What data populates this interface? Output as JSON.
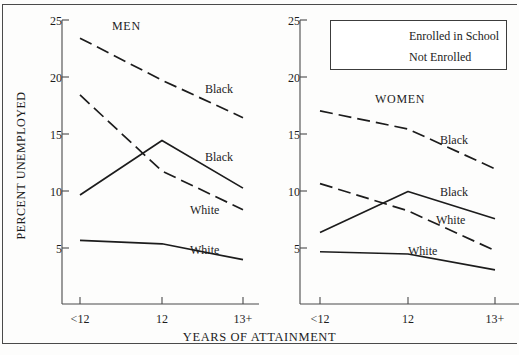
{
  "chart_data": {
    "type": "line",
    "title": "",
    "xlabel": "YEARS OF ATTAINMENT",
    "ylabel": "PERCENT UNEMPLOYED",
    "categories": [
      "<12",
      "12",
      "13+"
    ],
    "ylim": [
      0,
      25
    ],
    "yticks": [
      5,
      10,
      15,
      20,
      25
    ],
    "grid": false,
    "legend_position": "top-right",
    "legend": [
      {
        "name": "Enrolled in School",
        "style": "solid"
      },
      {
        "name": "Not Enrolled",
        "style": "dashed"
      }
    ],
    "panels": [
      {
        "name": "MEN",
        "series": [
          {
            "name": "Black",
            "enrollment": "Not Enrolled",
            "style": "dashed",
            "values": [
              23.4,
              19.7,
              16.4
            ],
            "label": "Black"
          },
          {
            "name": "White",
            "enrollment": "Not Enrolled",
            "style": "dashed",
            "values": [
              18.4,
              11.7,
              8.3
            ],
            "label": "White"
          },
          {
            "name": "Black",
            "enrollment": "Enrolled in School",
            "style": "solid",
            "values": [
              9.6,
              14.4,
              10.2
            ],
            "label": "Black"
          },
          {
            "name": "White",
            "enrollment": "Enrolled in School",
            "style": "solid",
            "values": [
              5.6,
              5.3,
              3.9
            ],
            "label": "White"
          }
        ]
      },
      {
        "name": "WOMEN",
        "series": [
          {
            "name": "Black",
            "enrollment": "Not Enrolled",
            "style": "dashed",
            "values": [
              17.0,
              15.4,
              11.9
            ],
            "label": "Black"
          },
          {
            "name": "White",
            "enrollment": "Not Enrolled",
            "style": "dashed",
            "values": [
              10.6,
              8.2,
              4.7
            ],
            "label": "White"
          },
          {
            "name": "Black",
            "enrollment": "Enrolled in School",
            "style": "solid",
            "values": [
              6.3,
              9.9,
              7.5
            ],
            "label": "Black"
          },
          {
            "name": "White",
            "enrollment": "Enrolled in School",
            "style": "solid",
            "values": [
              4.6,
              4.4,
              3.0
            ],
            "label": "White"
          }
        ]
      }
    ]
  },
  "axes": {
    "y_title": "PERCENT UNEMPLOYED",
    "x_title": "YEARS OF ATTAINMENT",
    "y_ticks": [
      "25",
      "20",
      "15",
      "10",
      "5"
    ],
    "x_ticks": [
      "<12",
      "12",
      "13+"
    ]
  },
  "panels": {
    "men": {
      "title": "MEN",
      "labels": {
        "black_not_enrolled": "Black",
        "black_enrolled": "Black",
        "white_not_enrolled": "White",
        "white_enrolled": "White"
      }
    },
    "women": {
      "title": "WOMEN",
      "labels": {
        "black_not_enrolled": "Black",
        "black_enrolled": "Black",
        "white_not_enrolled": "White",
        "white_enrolled": "White"
      }
    }
  },
  "legend": {
    "enrolled_label": "Enrolled in School",
    "not_enrolled_label": "Not Enrolled"
  },
  "colors": {
    "line": "#1c1c1c",
    "axis": "#4a4a4a",
    "background": "#fdfdfc"
  }
}
